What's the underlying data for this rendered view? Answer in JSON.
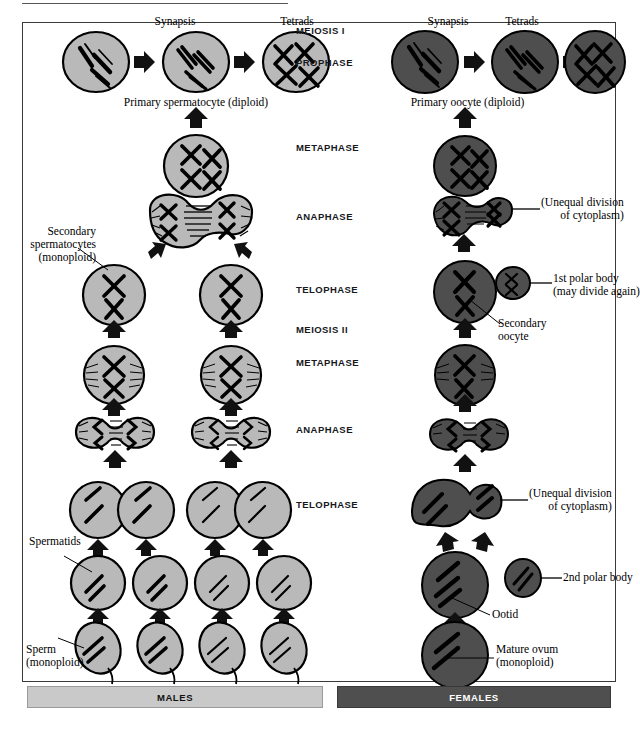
{
  "figure": {
    "title_rule": true,
    "colors": {
      "male_cell": "#b9b9b9",
      "female_cell": "#4e4e4e",
      "outline": "#000000",
      "males_bar_bg": "#c9c9c9",
      "females_bar_bg": "#4f4f4f",
      "background": "#ffffff"
    }
  },
  "center_labels": [
    {
      "text": "MEIOSIS I",
      "x": 300,
      "y": 26
    },
    {
      "text": "PROPHASE",
      "x": 300,
      "y": 58
    },
    {
      "text": "METAPHASE",
      "x": 300,
      "y": 143
    },
    {
      "text": "ANAPHASE",
      "x": 300,
      "y": 212
    },
    {
      "text": "TELOPHASE",
      "x": 300,
      "y": 285
    },
    {
      "text": "MEIOSIS II",
      "x": 300,
      "y": 325
    },
    {
      "text": "METAPHASE",
      "x": 300,
      "y": 358
    },
    {
      "text": "ANAPHASE",
      "x": 300,
      "y": 425
    },
    {
      "text": "TELOPHASE",
      "x": 300,
      "y": 500
    }
  ],
  "male": {
    "column_title": "MALES",
    "top_row_labels": [
      {
        "text": "Synapsis",
        "x": 175,
        "y": 22
      },
      {
        "text": "Tetrads",
        "x": 251,
        "y": 22
      }
    ],
    "primary_caption": "Primary spermatocyte (diploid)",
    "secondary_label": "Secondary\nspermatocytes\n(monoploid)",
    "secondary_label_lines": [
      "Secondary",
      "spermatocytes",
      "(monoploid)"
    ],
    "spermatids_label": "Spermatids",
    "sperm_label_lines": [
      "Sperm",
      "(monoploid)"
    ]
  },
  "female": {
    "column_title": "FEMALES",
    "top_row_labels": [
      {
        "text": "Synapsis",
        "x": 448,
        "y": 22
      },
      {
        "text": "Tetrads",
        "x": 521,
        "y": 22
      }
    ],
    "primary_caption": "Primary oocyte (diploid)",
    "unequal_division_1": [
      "(Unequal division",
      "of cytoplasm)"
    ],
    "first_polar_body": [
      "1st polar body",
      "(may divide again)"
    ],
    "secondary_oocyte": [
      "Secondary",
      "oocyte"
    ],
    "unequal_division_2": [
      "(Unequal division",
      "of cytoplasm)"
    ],
    "second_polar_body": "2nd polar body",
    "ootid_label": "Ootid",
    "mature_ovum": [
      "Mature ovum",
      "(monoploid)"
    ]
  },
  "icons": {
    "arrow_right": "right-arrow-icon",
    "arrow_down": "down-arrow-icon",
    "arrow_diagonal": "diagonal-arrow-icon"
  }
}
